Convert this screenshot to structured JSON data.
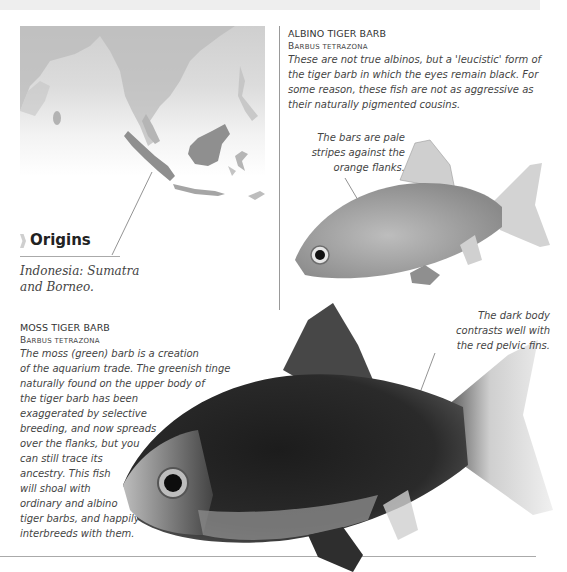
{
  "page": {
    "top_band_marker": "",
    "colors": {
      "map_land": "#a9a9a9",
      "map_highlight": "#8f8f8f",
      "divider": "#999999",
      "text": "#444444"
    }
  },
  "origins": {
    "heading": "Origins",
    "text_line1": "Indonesia: Sumatra",
    "text_line2": "and Borneo.",
    "map_icon": "southeast-asia-map"
  },
  "albino": {
    "title": "ALBINO TIGER BARB",
    "latin_cap1": "B",
    "latin_rest1": "ARBUS",
    "latin_rest2": "TETRAZONA",
    "description": "These are not true albinos, but a 'leucistic' form of the tiger barb in which the eyes remain black. For some reason, these fish are not as aggressive as their naturally pigmented cousins.",
    "callout_lines": [
      "The bars are pale",
      "stripes against the",
      "orange flanks."
    ]
  },
  "moss": {
    "title": "MOSS TIGER BARB",
    "latin_cap1": "B",
    "latin_rest1": "ARBUS",
    "latin_rest2": "TETRAZONA",
    "description_lines": [
      "The moss (green) barb is a creation",
      "of the aquarium trade. The greenish tinge",
      "naturally found on the upper body of",
      "the tiger barb has been",
      "exaggerated by selective",
      "breeding, and now spreads",
      "over the flanks, but you",
      "can still trace its",
      "ancestry. This fish",
      "will shoal with",
      "ordinary and albino",
      "tiger barbs, and happily",
      "interbreeds with them."
    ],
    "callout_lines": [
      "The dark body",
      "contrasts well with",
      "the red pelvic fins."
    ]
  }
}
